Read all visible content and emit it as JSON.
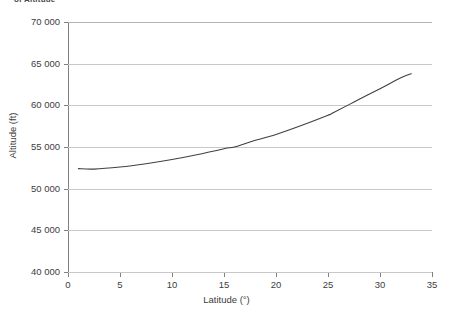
{
  "caption": {
    "text": "of Altitude"
  },
  "chart_data": {
    "type": "line",
    "title": "",
    "xlabel": "Latitude (°)",
    "ylabel": "Altitude (ft)",
    "xlim": [
      0,
      35
    ],
    "ylim": [
      40000,
      70000
    ],
    "grid": "horizontal",
    "legend": "none",
    "x_ticks": [
      "0",
      "5",
      "10",
      "15",
      "20",
      "25",
      "30",
      "35"
    ],
    "x_tick_values": [
      0,
      5,
      10,
      15,
      20,
      25,
      30,
      35
    ],
    "y_ticks": [
      "40 000",
      "45 000",
      "50 000",
      "55 000",
      "60 000",
      "65 000",
      "70 000"
    ],
    "y_tick_values": [
      40000,
      45000,
      50000,
      55000,
      60000,
      65000,
      70000
    ],
    "series": [
      {
        "name": "Altitude vs Latitude",
        "color": "#404040",
        "x": [
          1.0,
          2.5,
          5.0,
          7.5,
          10.0,
          12.5,
          15.0,
          16.0,
          17.5,
          20.0,
          22.5,
          25.0,
          25.5,
          27.5,
          30.0,
          32.0,
          33.0
        ],
        "values": [
          52400,
          52350,
          52600,
          53000,
          53500,
          54100,
          54800,
          55000,
          55600,
          56500,
          57600,
          58800,
          59100,
          60400,
          62000,
          63300,
          63800
        ]
      }
    ]
  },
  "colors": {
    "curve": "#404040",
    "gridline": "#c8c8c8",
    "axis": "#808080",
    "text": "#3d3d3d",
    "background": "#ffffff"
  }
}
